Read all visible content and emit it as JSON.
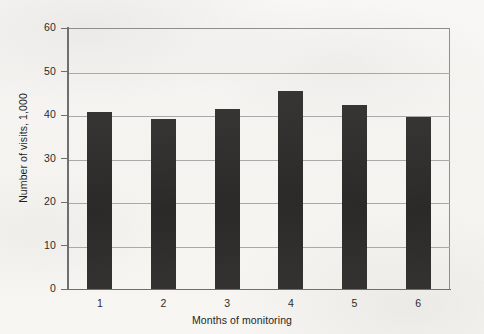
{
  "figure": {
    "background_color": "#f7f6f4",
    "bar_color": "#2e2c2b",
    "grid_color": "#a9a9a9",
    "axis_color": "#6f6f6f"
  },
  "chart_data": {
    "type": "bar",
    "title": "",
    "subtitle": "",
    "xlabel": "Months of monitoring",
    "ylabel": "Number of visits, 1,000",
    "categories": [
      "1",
      "2",
      "3",
      "4",
      "5",
      "6"
    ],
    "values": [
      40.6,
      39.1,
      41.4,
      45.5,
      42.3,
      39.6
    ],
    "ylim": [
      0,
      60
    ],
    "xlim_categories": 6,
    "y_ticks": [
      0,
      10,
      20,
      30,
      40,
      50,
      60
    ],
    "y_tick_labels": [
      "0",
      "10",
      "20",
      "30",
      "40",
      "50",
      "60"
    ],
    "x_tick_labels": [
      "1",
      "2",
      "3",
      "4",
      "5",
      "6"
    ],
    "grid": "horizontal",
    "legend": "none",
    "annotations": []
  }
}
